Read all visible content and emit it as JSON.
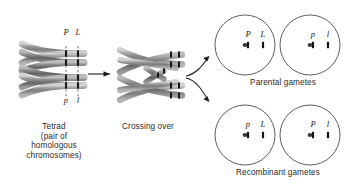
{
  "diagram": {
    "stages": [
      {
        "id": "tetrad",
        "caption": "Tetrad\n(pair of\nhomologous\nchromosomes)",
        "alleles_top": [
          "P",
          "L"
        ],
        "alleles_bottom": [
          "p",
          "l"
        ]
      },
      {
        "id": "crossing-over",
        "caption": "Crossing over"
      }
    ],
    "gamete_groups": [
      {
        "id": "parental",
        "caption": "Parental gametes",
        "gametes": [
          {
            "id": "parental-1",
            "alleles": [
              "P",
              "L"
            ]
          },
          {
            "id": "parental-2",
            "alleles": [
              "p",
              "l"
            ]
          }
        ]
      },
      {
        "id": "recombinant",
        "caption": "Recombinant gametes",
        "gametes": [
          {
            "id": "recombinant-1",
            "alleles": [
              "p",
              "L"
            ]
          },
          {
            "id": "recombinant-2",
            "alleles": [
              "P",
              "l"
            ]
          }
        ]
      }
    ],
    "arrows": [
      {
        "id": "tetrad-to-crossing",
        "shape": "straight-right"
      },
      {
        "id": "crossing-to-parental",
        "shape": "curved-up-right"
      },
      {
        "id": "crossing-to-recombinant",
        "shape": "curved-down-right"
      }
    ],
    "colors": {
      "chromatid_light": "#b9b9b9",
      "chromatid_mid": "#8e8e8e",
      "chromatid_dark": "#6a6a6a",
      "band": "#1c1c1c",
      "outline": "#5a5a5a",
      "circle_stroke": "#4d4d4d",
      "text": "#2b2b2b",
      "background": "#ffffff"
    }
  }
}
